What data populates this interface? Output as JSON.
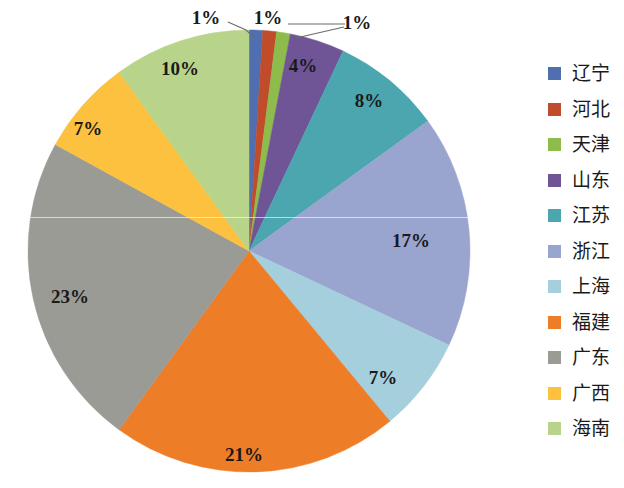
{
  "chart_data": {
    "type": "pie",
    "title": "",
    "categories": [
      "辽宁",
      "河北",
      "天津",
      "山东",
      "江苏",
      "浙江",
      "上海",
      "福建",
      "广东",
      "广西",
      "海南"
    ],
    "values": [
      1,
      1,
      1,
      4,
      8,
      17,
      7,
      21,
      23,
      7,
      10
    ],
    "value_labels": [
      "1%",
      "1%",
      "1%",
      "4%",
      "8%",
      "17%",
      "7%",
      "21%",
      "23%",
      "7%",
      "10%"
    ],
    "colors": [
      "#4f6fb0",
      "#c04c2b",
      "#8dbb4c",
      "#6f5496",
      "#4ba6b0",
      "#9aa5cf",
      "#a5cfdd",
      "#ed7d26",
      "#9b9b96",
      "#fbc13f",
      "#b8d48a"
    ],
    "unit": "%",
    "legend_position": "right",
    "grid": false,
    "start_angle_deg": 0,
    "direction": "clockwise",
    "total": 100
  },
  "legend": {
    "items": [
      {
        "label": "辽宁",
        "color": "#4f6fb0",
        "value_label": "1%"
      },
      {
        "label": "河北",
        "color": "#c04c2b",
        "value_label": "1%"
      },
      {
        "label": "天津",
        "color": "#8dbb4c",
        "value_label": "1%"
      },
      {
        "label": "山东",
        "color": "#6f5496",
        "value_label": "4%"
      },
      {
        "label": "江苏",
        "color": "#4ba6b0",
        "value_label": "8%"
      },
      {
        "label": "浙江",
        "color": "#9aa5cf",
        "value_label": "17%"
      },
      {
        "label": "上海",
        "color": "#a5cfdd",
        "value_label": "7%"
      },
      {
        "label": "福建",
        "color": "#ed7d26",
        "value_label": "21%"
      },
      {
        "label": "广东",
        "color": "#9b9b96",
        "value_label": "23%"
      },
      {
        "label": "广西",
        "color": "#fbc13f",
        "value_label": "7%"
      },
      {
        "label": "海南",
        "color": "#b8d48a",
        "value_label": "10%"
      }
    ]
  },
  "slice_labels": [
    {
      "text": "1%",
      "x": 206,
      "y": 18,
      "leader": true
    },
    {
      "text": "1%",
      "x": 268,
      "y": 18,
      "leader": true
    },
    {
      "text": "1%",
      "x": 357,
      "y": 23,
      "leader": true
    },
    {
      "text": "4%",
      "x": 303,
      "y": 66,
      "leader": false
    },
    {
      "text": "8%",
      "x": 369,
      "y": 101,
      "leader": false
    },
    {
      "text": "17%",
      "x": 411,
      "y": 241,
      "leader": false
    },
    {
      "text": "7%",
      "x": 383,
      "y": 378,
      "leader": false
    },
    {
      "text": "21%",
      "x": 244,
      "y": 455,
      "leader": false
    },
    {
      "text": "23%",
      "x": 70,
      "y": 297,
      "leader": false
    },
    {
      "text": "7%",
      "x": 88,
      "y": 129,
      "leader": false
    },
    {
      "text": "10%",
      "x": 180,
      "y": 69,
      "leader": false
    }
  ]
}
